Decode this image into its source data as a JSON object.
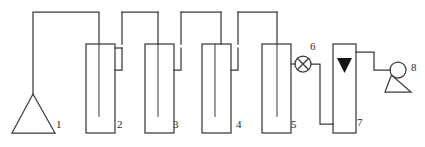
{
  "figure": {
    "type": "process-flow-diagram",
    "background_color": "#ffffff",
    "line_color": "#3a3a3a",
    "label_color": "#2b2b2b",
    "fill_color": "#141414"
  },
  "components": [
    {
      "id": "1",
      "label": "1",
      "name": "gas-source-triangle",
      "shape": "triangle-open",
      "label_x": 56,
      "label_y": 128
    },
    {
      "id": "2",
      "label": "2",
      "name": "absorber-vessel-2",
      "shape": "rectangle-with-dip-tube",
      "label_x": 117,
      "label_y": 128
    },
    {
      "id": "3",
      "label": "3",
      "name": "absorber-vessel-3",
      "shape": "rectangle-with-dip-tube",
      "label_x": 173,
      "label_y": 128
    },
    {
      "id": "4",
      "label": "4",
      "name": "absorber-vessel-4",
      "shape": "rectangle-with-dip-tube",
      "label_x": 236,
      "label_y": 128
    },
    {
      "id": "5",
      "label": "5",
      "name": "absorber-vessel-5",
      "shape": "rectangle-with-dip-tube",
      "label_x": 291,
      "label_y": 128
    },
    {
      "id": "6",
      "label": "6",
      "name": "valve-crossed-circle",
      "shape": "circle-with-x",
      "label_x": 310,
      "label_y": 50
    },
    {
      "id": "7",
      "label": "7",
      "name": "adsorber-column-7",
      "shape": "rectangle-with-filled-triangle",
      "label_x": 357,
      "label_y": 126
    },
    {
      "id": "8",
      "label": "8",
      "name": "pump-circle-triangle",
      "shape": "circle-on-triangle",
      "label_x": 411,
      "label_y": 71
    }
  ]
}
